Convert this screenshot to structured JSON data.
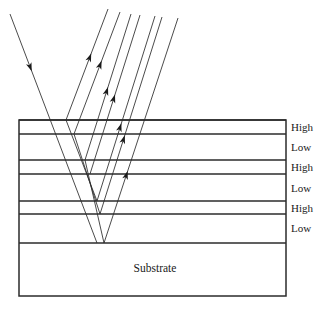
{
  "diagram": {
    "colors": {
      "line": "#2b2b2b",
      "text": "#1a1a1a",
      "background": "#ffffff"
    },
    "stack": {
      "left": 19,
      "right": 286,
      "top": 120,
      "bottom": 296,
      "substrate_top": 243,
      "boundaries": [
        120,
        134,
        160,
        174,
        201,
        214,
        243
      ],
      "layers": [
        {
          "index": 0,
          "label": "High",
          "top": 120,
          "bottom": 134,
          "label_y": 131
        },
        {
          "index": 1,
          "label": "Low",
          "top": 134,
          "bottom": 160,
          "label_y": 151
        },
        {
          "index": 2,
          "label": "High",
          "top": 160,
          "bottom": 174,
          "label_y": 171
        },
        {
          "index": 3,
          "label": "Low",
          "top": 174,
          "bottom": 201,
          "label_y": 192
        },
        {
          "index": 4,
          "label": "High",
          "top": 201,
          "bottom": 214,
          "label_y": 212
        },
        {
          "index": 5,
          "label": "Low",
          "top": 214,
          "bottom": 243,
          "label_y": 232
        }
      ],
      "substrate": {
        "label": "Substrate",
        "label_x": 155,
        "label_y": 272,
        "top": 243,
        "bottom": 296
      },
      "label_x": 291
    },
    "rays": {
      "incident": {
        "name": "incident-ray",
        "x1": 10,
        "y1": 14,
        "x2": 97,
        "y2": 243,
        "arrow_at": 0.25
      },
      "reflected": [
        {
          "name": "reflected-ray-1",
          "x1": 66,
          "y1": 120,
          "x2": 108,
          "y2": 9,
          "arrow_at": 0.6
        },
        {
          "name": "reflected-ray-2",
          "x1": 74,
          "y1": 134,
          "x2": 120,
          "y2": 12,
          "arrow_at": 0.6
        },
        {
          "name": "reflected-ray-3",
          "x1": 85,
          "y1": 160,
          "x2": 131,
          "y2": 14,
          "arrow_at": 0.5
        },
        {
          "name": "reflected-ray-4",
          "x1": 90,
          "y1": 174,
          "x2": 140,
          "y2": 15,
          "arrow_at": 0.5
        },
        {
          "name": "reflected-ray-5",
          "x1": 97,
          "y1": 201,
          "x2": 155,
          "y2": 16,
          "arrow_at": 0.42
        },
        {
          "name": "reflected-ray-6",
          "x1": 100,
          "y1": 214,
          "x2": 162,
          "y2": 17,
          "arrow_at": 0.4
        },
        {
          "name": "reflected-ray-7",
          "x1": 104,
          "y1": 243,
          "x2": 178,
          "y2": 18,
          "arrow_at": 0.32
        }
      ],
      "internal": [
        {
          "name": "internal-ray-1",
          "x1": 66,
          "y1": 120,
          "x2": 97,
          "y2": 201
        },
        {
          "name": "internal-ray-2",
          "x1": 74,
          "y1": 134,
          "x2": 100,
          "y2": 214
        },
        {
          "name": "internal-ray-3",
          "x1": 85,
          "y1": 160,
          "x2": 104,
          "y2": 243
        }
      ]
    }
  }
}
